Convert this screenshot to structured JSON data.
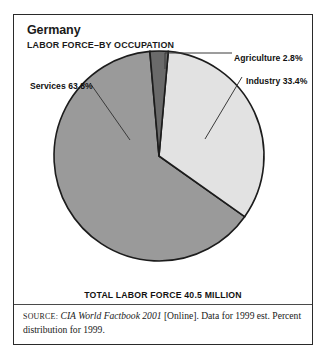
{
  "figure": {
    "title": "Germany",
    "subtitle": "LABOR FORCE–BY OCCUPATION",
    "total_caption": "TOTAL LABOR FORCE 40.5 MILLION",
    "source": {
      "label": "SOURCE:",
      "work": "CIA World Factbook 2001",
      "rest": " [Online]. Data for 1999 est. Percent distribution for 1999."
    },
    "frame_color": "#2a2a2a",
    "background_color": "#ffffff"
  },
  "labels": {
    "services": "Services 63.8%",
    "agriculture": "Agriculture 2.8%",
    "industry": "Industry 33.4%"
  },
  "chart_data": {
    "type": "pie",
    "subtitle": "TOTAL LABOR FORCE 40.5 MILLION",
    "xlabel": "",
    "ylabel": "",
    "unit": "percent",
    "total_label": "TOTAL LABOR FORCE 40.5 MILLION",
    "total_value": 40.5,
    "total_unit": "million",
    "categories": [
      "Agriculture",
      "Industry",
      "Services"
    ],
    "values": [
      2.8,
      33.4,
      63.8
    ],
    "data_labels": [
      "Agriculture 2.8%",
      "Industry 33.4%",
      "Services 63.8%"
    ],
    "slice_colors": [
      "#6a6a6a",
      "#e2e2e2",
      "#9a9a9a"
    ],
    "slice_stroke": "#1c1c1c",
    "start_angle_deg": -5,
    "direction": "clockwise",
    "legend": "none",
    "grid": false,
    "annotations": [
      {
        "text": "Agriculture 2.8%",
        "leader": true,
        "side": "right-top"
      },
      {
        "text": "Industry 33.4%",
        "leader": true,
        "side": "right"
      },
      {
        "text": "Services 63.8%",
        "leader": true,
        "side": "left"
      }
    ]
  }
}
